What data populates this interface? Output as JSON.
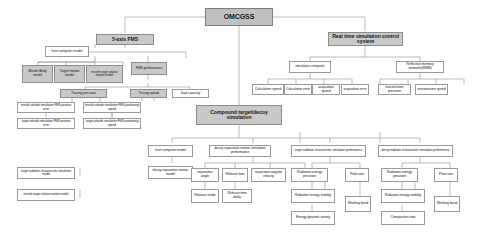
{
  "diagram": {
    "type": "hierarchy-tree",
    "colors": {
      "root_fill": "#c0c0c0",
      "shaded_fill": "#c9c9c9",
      "node_fill": "#ffffff",
      "border": "#9a9a9a",
      "text": "#1a1a1a",
      "background": "#ffffff"
    },
    "nodes": {
      "root": "OMCGSS",
      "five_axis_fms": "5-axis FMS",
      "real_time_control": "Real time simulation control system",
      "compound_sim": "Compound target/decoy simulation",
      "host_computer_model_left": "host computer model",
      "missile_body_model": "Missile Body model",
      "target_motion_model": "Target motion model",
      "missile_target_relative_motion_model": "missile target relative motion model",
      "fms_performance": "FMS performance",
      "tracing_precision": "Tracing precision",
      "tracing_speed": "Tracing speed",
      "load_capacity": "load capacity",
      "missile_attitude_position_error": "missile attitude simulation FMS position error",
      "missile_attitude_positioning_speed": "missile attitude simulation FMS positioning speed",
      "target_attitude_position_error": "target attitude simulation FMS position error",
      "target_attitude_positioning_speed": "target attitude simulation FMS positioning speed",
      "simulation_computer": "simulation computer",
      "reflective_memory_network": "Reflective memory networks(RMN)",
      "calculation_speed": "Calculation speed",
      "calculation_error": "Calculation error",
      "acquisition_speed": "acquisition speed",
      "acquisition_error": "acquisition error",
      "transmission_precision": "transmission precision",
      "transmission_speed": "transmission speed",
      "host_computer_model_bottom": "host computer model",
      "decoy_separation_motion_sim_performance": "decoy separation motion simulation performance",
      "target_radiation_characteristic": "target radiation characteristic simulation performance",
      "decoy_radiation_characteristic": "decoy radiation characteristic simulation performance",
      "target_radiation_characteristic_model": "target radiation characteristic simulation model",
      "decoy_separation_motion_model": "decoy separation motion model",
      "missile_target_relative_motion_model_bottom": "missile target relative motion model",
      "separation_angle": "separation angle",
      "release_time": "Release time",
      "separation_angular_velocity": "separation angular velocity",
      "radiation_energy_precision_left": "Radiation energy precision",
      "point_size_left": "Point size",
      "radiation_energy_precision_right": "Radiation energy precision",
      "point_size_right": "Point size",
      "release_mode": "Release mode",
      "release_time_delay": "Release time delay",
      "radiation_energy_stability_left": "Radiation energy stability",
      "energy_dynamic_variety": "Energy dynamic variety",
      "working_band_left": "Working band",
      "radiation_energy_stability_right": "Radiation energy stability",
      "compaction_ratio": "Compaction ratio",
      "working_band_right": "Working band"
    }
  }
}
